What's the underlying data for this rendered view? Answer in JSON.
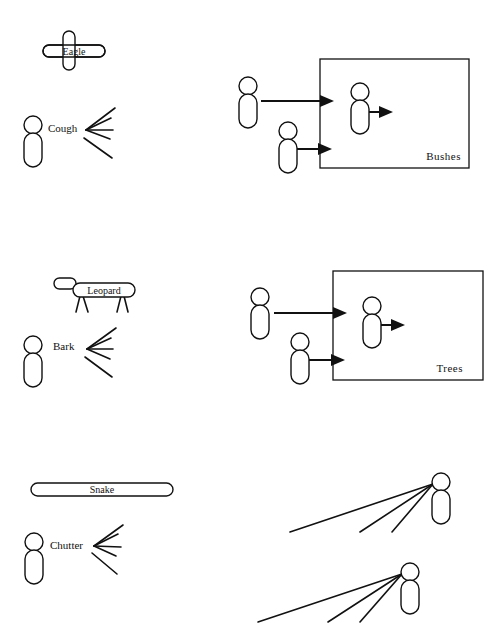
{
  "panels": [
    {
      "predator": "Eagle",
      "call": "Cough",
      "response_location": "Bushes",
      "response": "run-into-cover"
    },
    {
      "predator": "Leopard",
      "call": "Bark",
      "response_location": "Trees",
      "response": "run-into-cover"
    },
    {
      "predator": "Snake",
      "call": "Chutter",
      "response_location": "",
      "response": "look-down"
    }
  ],
  "colors": {
    "ink": "#111111",
    "background": "#ffffff"
  }
}
